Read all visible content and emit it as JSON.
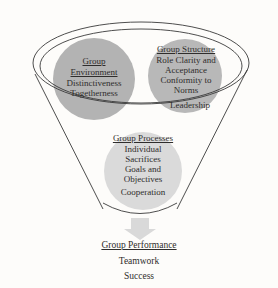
{
  "diagram": {
    "type": "funnel-process-diagram",
    "background_color": "#fdfcfa",
    "outline_color": "#3a3a3a",
    "nodes": {
      "group_environment": {
        "title": "Group Environment",
        "title_line_1": "Group",
        "title_line_2": "Environment",
        "items": [
          "Distinctiveness",
          "Togetherness"
        ],
        "shape": "circle",
        "fill_color": "#b3b3b3"
      },
      "group_structure": {
        "title": "Group Structure",
        "items": [
          "Role Clarity and",
          "Acceptance",
          "Conformity to",
          "Norms"
        ],
        "shape": "circle",
        "fill_color": "#b8b8b8"
      },
      "leadership": {
        "label": "Leadership"
      },
      "group_processes": {
        "title": "Group Processes",
        "items": [
          "Individual",
          "Sacrifices",
          "Goals and",
          "Objectives",
          "Cooperation"
        ],
        "shape": "circle",
        "fill_color": "#dadada"
      },
      "group_performance": {
        "title": "Group Performance",
        "items": [
          "Teamwork",
          "Success"
        ],
        "arrow": "down-arrow",
        "arrow_color": "#d9d9d9"
      }
    }
  }
}
